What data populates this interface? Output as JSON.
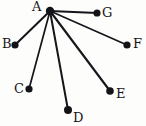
{
  "document": {
    "title": "Star graph with center A",
    "background_color": "#fdfdfc",
    "ink_color": "#17151a",
    "style": "hand-drawn"
  },
  "chart_data": {
    "type": "diagram",
    "diagram_type": "graph",
    "title": "",
    "layout": "star",
    "center_node": "A",
    "node_count": 7,
    "edge_count": 6,
    "canvas": {
      "width": 146,
      "height": 126
    },
    "nodes": [
      {
        "id": "A",
        "label": "A",
        "x": 50,
        "y": 11,
        "r": 4.2,
        "label_x": 32,
        "label_y": 0
      },
      {
        "id": "B",
        "label": "B",
        "x": 15,
        "y": 45,
        "r": 3.6,
        "label_x": 2,
        "label_y": 37
      },
      {
        "id": "C",
        "label": "C",
        "x": 29,
        "y": 89,
        "r": 3.6,
        "label_x": 14,
        "label_y": 82
      },
      {
        "id": "D",
        "label": "D",
        "x": 68,
        "y": 110,
        "r": 4.0,
        "label_x": 73,
        "label_y": 111
      },
      {
        "id": "E",
        "label": "E",
        "x": 110,
        "y": 91,
        "r": 3.8,
        "label_x": 116,
        "label_y": 87
      },
      {
        "id": "F",
        "label": "F",
        "x": 127,
        "y": 45,
        "r": 3.6,
        "label_x": 133,
        "label_y": 37
      },
      {
        "id": "G",
        "label": "G",
        "x": 97,
        "y": 13,
        "r": 3.6,
        "label_x": 102,
        "label_y": 6
      }
    ],
    "edges": [
      {
        "from": "A",
        "to": "B",
        "width": 2.0
      },
      {
        "from": "A",
        "to": "C",
        "width": 1.7
      },
      {
        "from": "A",
        "to": "D",
        "width": 2.0
      },
      {
        "from": "A",
        "to": "E",
        "width": 2.1
      },
      {
        "from": "A",
        "to": "F",
        "width": 1.7
      },
      {
        "from": "A",
        "to": "G",
        "width": 2.1
      }
    ]
  }
}
